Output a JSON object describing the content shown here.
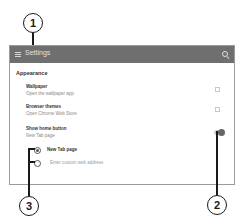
{
  "header": {
    "title": "Settings",
    "menu_icon": "hamburger-menu-icon",
    "search_icon": "search-icon",
    "background": "#6f6f6f"
  },
  "section": {
    "title": "Appearance"
  },
  "settings": [
    {
      "title": "Wallpaper",
      "subtitle": "Open the wallpaper app",
      "icon": "external-link-icon"
    },
    {
      "title": "Browser themes",
      "subtitle": "Open Chrome Web Store",
      "icon": "external-link-icon"
    },
    {
      "title": "Show home button",
      "subtitle": "New Tab page",
      "toggle": "on"
    }
  ],
  "home_options": [
    {
      "label": "New Tab page",
      "selected": true
    },
    {
      "label": "Enter custom web address",
      "selected": false
    }
  ],
  "callouts": [
    {
      "number": "1",
      "target": "Appearance section"
    },
    {
      "number": "2",
      "target": "Show home button toggle"
    },
    {
      "number": "3",
      "target": "Home page radio options"
    }
  ]
}
